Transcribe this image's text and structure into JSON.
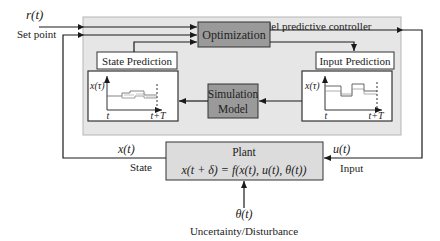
{
  "signals": {
    "reference": "r(t)",
    "reference_label": "Set point",
    "state": "x(t)",
    "state_label": "State",
    "input": "u(t)",
    "input_label": "Input",
    "disturbance": "θ(t)",
    "disturbance_label": "Uncertainty/Disturbance"
  },
  "controller": {
    "label": "Model predictive controller",
    "optimization": "Optimization",
    "simulation_line1": "Simulation",
    "simulation_line2": "Model",
    "state_prediction": {
      "title": "State Prediction",
      "y_label": "x(τ)",
      "x_start": "t",
      "x_end": "t+T"
    },
    "input_prediction": {
      "title": "Input Prediction",
      "y_label": "x(τ)",
      "x_start": "t",
      "x_end": "t+T"
    }
  },
  "plant": {
    "title": "Plant",
    "equation": "x(t + δ) = f(x(t), u(t), θ(t))"
  },
  "colors": {
    "controller_bg": "#e6e6e6",
    "block_fill": "#9a9a9a",
    "plant_fill": "#dcdcdc",
    "line": "#1a1a1a"
  }
}
